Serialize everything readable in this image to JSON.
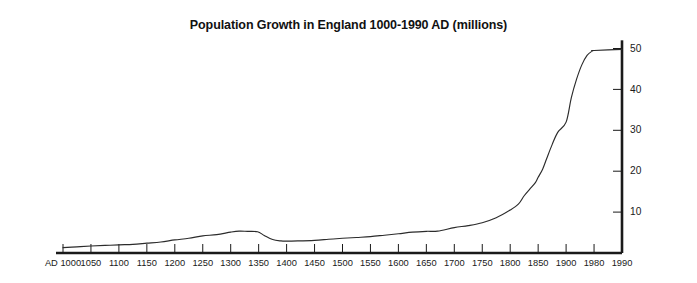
{
  "chart_data": {
    "type": "line",
    "title": "Population Growth in England 1000-1990 AD (millions)",
    "xlabel": "",
    "ylabel": "",
    "ylim": [
      0,
      52
    ],
    "yticks": [
      10,
      20,
      30,
      40,
      50
    ],
    "ytick_labels": [
      "10",
      "20",
      "30",
      "40",
      "50"
    ],
    "y_axis_position": "right",
    "x_axis_position": "bottom",
    "grid": false,
    "legend": null,
    "x_tick_labels": [
      "AD 1000",
      "1050",
      "1100",
      "1150",
      "1200",
      "1250",
      "1300",
      "1350",
      "1400",
      "1450",
      "1500",
      "1550",
      "1600",
      "1650",
      "1700",
      "1750",
      "1800",
      "1850",
      "1900",
      "1980",
      "1990"
    ],
    "x": [
      1000,
      1050,
      1100,
      1150,
      1200,
      1250,
      1300,
      1350,
      1400,
      1450,
      1500,
      1550,
      1600,
      1650,
      1700,
      1750,
      1800,
      1850,
      1900,
      1980,
      1990
    ],
    "values": [
      1.3,
      1.7,
      2.0,
      2.4,
      3.2,
      4.2,
      5.1,
      4.6,
      2.9,
      3.1,
      3.6,
      4.0,
      4.7,
      5.3,
      6.2,
      7.4,
      10.5,
      18.5,
      32.0,
      49.5,
      49.8
    ],
    "series_name": "Population of England (millions)",
    "line_color": "#2b2b2b",
    "background_color": "#ffffff",
    "axis_color": "#1a1a1a",
    "curve_points": [
      [
        1000,
        1.3
      ],
      [
        1025,
        1.5
      ],
      [
        1050,
        1.7
      ],
      [
        1075,
        1.85
      ],
      [
        1100,
        2.0
      ],
      [
        1125,
        2.1
      ],
      [
        1150,
        2.4
      ],
      [
        1175,
        2.7
      ],
      [
        1200,
        3.2
      ],
      [
        1225,
        3.6
      ],
      [
        1250,
        4.2
      ],
      [
        1275,
        4.5
      ],
      [
        1300,
        5.1
      ],
      [
        1315,
        5.35
      ],
      [
        1330,
        5.3
      ],
      [
        1348,
        5.2
      ],
      [
        1360,
        4.3
      ],
      [
        1375,
        3.3
      ],
      [
        1390,
        2.95
      ],
      [
        1400,
        2.9
      ],
      [
        1420,
        2.95
      ],
      [
        1450,
        3.1
      ],
      [
        1475,
        3.35
      ],
      [
        1500,
        3.6
      ],
      [
        1525,
        3.8
      ],
      [
        1550,
        4.0
      ],
      [
        1575,
        4.35
      ],
      [
        1600,
        4.7
      ],
      [
        1625,
        5.1
      ],
      [
        1650,
        5.3
      ],
      [
        1670,
        5.35
      ],
      [
        1700,
        6.2
      ],
      [
        1725,
        6.7
      ],
      [
        1750,
        7.4
      ],
      [
        1775,
        8.6
      ],
      [
        1800,
        10.5
      ],
      [
        1815,
        12.0
      ],
      [
        1825,
        14.0
      ],
      [
        1835,
        15.6
      ],
      [
        1845,
        17.2
      ],
      [
        1850,
        18.5
      ],
      [
        1858,
        20.5
      ],
      [
        1865,
        23.0
      ],
      [
        1875,
        26.5
      ],
      [
        1885,
        29.5
      ],
      [
        1900,
        32.0
      ],
      [
        1915,
        38.0
      ],
      [
        1930,
        42.5
      ],
      [
        1945,
        46.0
      ],
      [
        1960,
        48.3
      ],
      [
        1975,
        49.4
      ],
      [
        1980,
        49.5
      ],
      [
        1990,
        49.8
      ]
    ],
    "annotations": [
      {
        "label": "Black Death decline",
        "x_range": [
          1350,
          1400
        ]
      }
    ]
  }
}
